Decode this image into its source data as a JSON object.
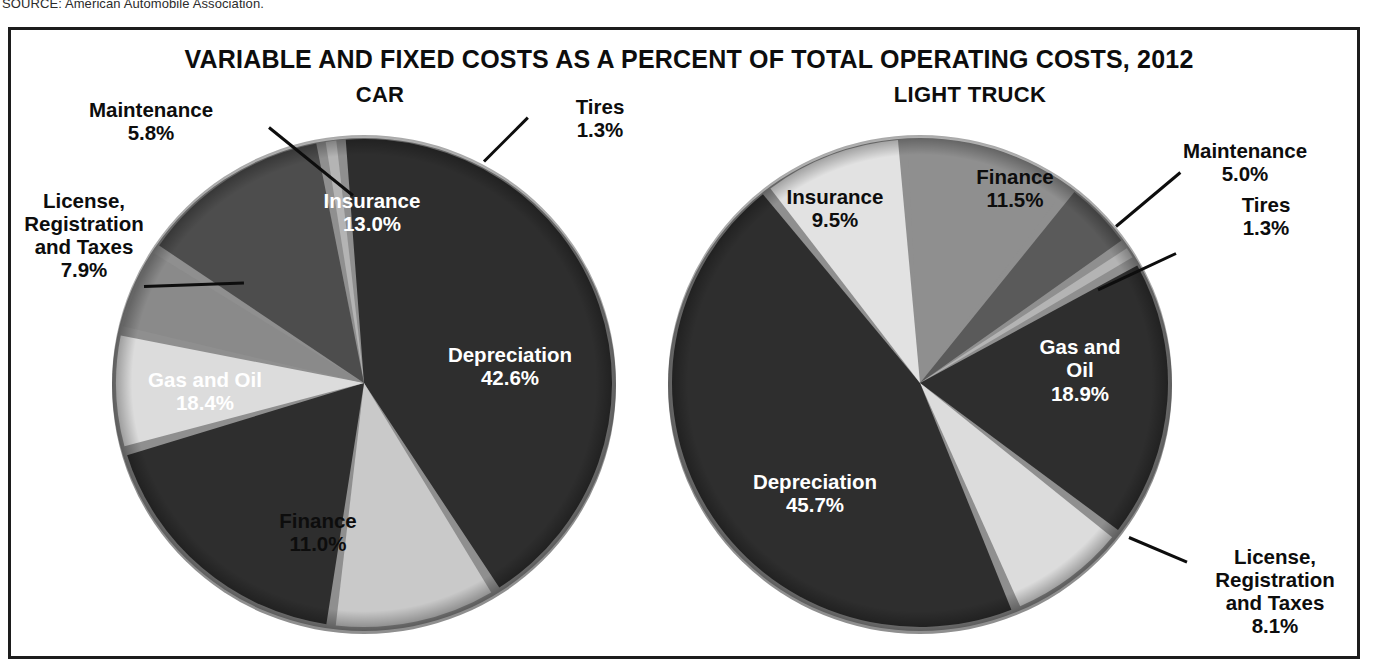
{
  "source_note": "SOURCE: American Automobile Association.",
  "chart_title": "VARIABLE AND FIXED COSTS AS A PERCENT OF TOTAL OPERATING COSTS, 2012",
  "panels": {
    "car": {
      "title": "CAR"
    },
    "truck": {
      "title": "LIGHT TRUCK"
    }
  },
  "labels": {
    "car": {
      "maintenance_name": "Maintenance",
      "maintenance_value": "5.8%",
      "license_line1": "License,",
      "license_line2": "Registration",
      "license_line3": "and Taxes",
      "license_value": "7.9%",
      "gas_name": "Gas and Oil",
      "gas_value": "18.4%",
      "finance_name": "Finance",
      "finance_value": "11.0%",
      "depreciation_name": "Depreciation",
      "depreciation_value": "42.6%",
      "insurance_name": "Insurance",
      "insurance_value": "13.0%",
      "tires_name": "Tires",
      "tires_value": "1.3%"
    },
    "truck": {
      "insurance_name": "Insurance",
      "insurance_value": "9.5%",
      "finance_name": "Finance",
      "finance_value": "11.5%",
      "maintenance_name": "Maintenance",
      "maintenance_value": "5.0%",
      "tires_name": "Tires",
      "tires_value": "1.3%",
      "gas_line1": "Gas and",
      "gas_line2": "Oil",
      "gas_value": "18.9%",
      "depreciation_name": "Depreciation",
      "depreciation_value": "45.7%",
      "license_line1": "License,",
      "license_line2": "Registration",
      "license_line3": "and Taxes",
      "license_value": "8.1%"
    }
  },
  "colors": {
    "frame_border": "#1d1d1d",
    "text_dark": "#0d0d0d",
    "text_light": "#ffffff",
    "depreciation": "#2e2e2e",
    "gas_and_oil": "#2e2e2e",
    "insurance_car": "#4d4d4d",
    "insurance_truck": "#e2e2e2",
    "finance_car": "#c9c9c9",
    "finance_truck": "#8f8f8f",
    "maintenance_car": "#8a8a8a",
    "maintenance_truck": "#5a5a5a",
    "license": "#dcdcdc",
    "tires": "#b4b4b4",
    "rim": "#9a9a9a"
  },
  "chart_data": [
    {
      "type": "pie",
      "title": "CAR",
      "categories": [
        "Depreciation",
        "Gas and Oil",
        "Insurance",
        "Finance",
        "License, Registration and Taxes",
        "Maintenance",
        "Tires"
      ],
      "values": [
        42.6,
        18.4,
        13.0,
        11.0,
        7.9,
        5.8,
        1.3
      ],
      "unit": "percent",
      "labels": [
        "42.6%",
        "18.4%",
        "13.0%",
        "11.0%",
        "7.9%",
        "5.8%",
        "1.3%"
      ],
      "legend": "none",
      "slice_order_clockwise_from_top": [
        "Tires",
        "Depreciation",
        "Finance",
        "Gas and Oil",
        "License, Registration and Taxes",
        "Maintenance",
        "Insurance"
      ],
      "start_angle_deg": 350
    },
    {
      "type": "pie",
      "title": "LIGHT TRUCK",
      "categories": [
        "Depreciation",
        "Gas and Oil",
        "Finance",
        "Insurance",
        "License, Registration and Taxes",
        "Maintenance",
        "Tires"
      ],
      "values": [
        45.7,
        18.9,
        11.5,
        9.5,
        8.1,
        5.0,
        1.3
      ],
      "unit": "percent",
      "labels": [
        "45.7%",
        "18.9%",
        "11.5%",
        "9.5%",
        "8.1%",
        "5.0%",
        "1.3%"
      ],
      "legend": "none",
      "slice_order_clockwise_from_top": [
        "Finance",
        "Maintenance",
        "Tires",
        "Gas and Oil",
        "License, Registration and Taxes",
        "Depreciation",
        "Insurance"
      ],
      "start_angle_deg": 356
    }
  ]
}
